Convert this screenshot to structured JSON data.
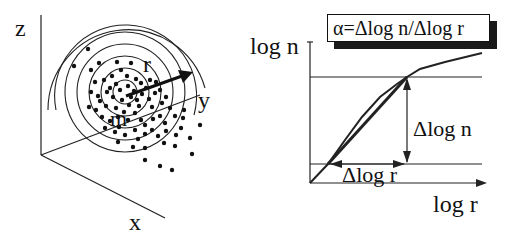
{
  "left_diagram": {
    "axis_labels": {
      "z": "z",
      "x": "x",
      "y": "y"
    },
    "radius_label": "r",
    "center_label": "m",
    "ring_count": 7,
    "description": "3D scatter of points around center m with concentric circles of radius r"
  },
  "right_diagram": {
    "y_axis_label": "log n",
    "x_axis_label": "log r",
    "formula": "α=Δlog n/Δlog r",
    "delta_n_label": "Δlog n",
    "delta_r_label": "Δlog r"
  },
  "colors": {
    "ink": "#111111",
    "background": "#ffffff"
  }
}
